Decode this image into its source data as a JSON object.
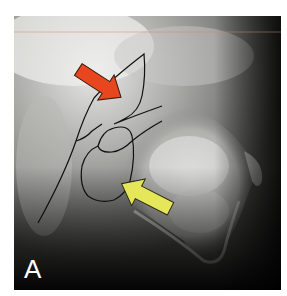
{
  "figure": {
    "panel_label": "A",
    "annotations": [
      {
        "type": "arrow",
        "color": "#e8461e",
        "direction": "down-right",
        "name": "red-arrow"
      },
      {
        "type": "arrow",
        "color": "#e6e65a",
        "direction": "up-left",
        "name": "yellow-arrow"
      }
    ],
    "tracing_color": "#111111",
    "reference_line_color": "#d08a7a"
  }
}
